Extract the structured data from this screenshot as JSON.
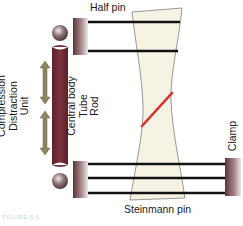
{
  "diagram": {
    "labels": {
      "half_pin": "Half pin",
      "steinmann_pin": "Steinmann pin",
      "clamp": "Clamp",
      "central_body": [
        "Central body",
        "Tube",
        "Rod"
      ],
      "compression_distraction": [
        "Compression",
        "Distraction",
        "Unit"
      ]
    },
    "caption": "FIGURE 5.5",
    "colors": {
      "rod": "#6e2a34",
      "clamp_dark": "#5a3338",
      "clamp_light": "#e8dcdc",
      "bone_fill": "#f6f3e4",
      "bone_stroke": "#555555",
      "pin": "#111111",
      "fracture": "#d8312a",
      "arrow": "#8a8560",
      "ball": "#6a5458"
    },
    "components": [
      {
        "id": "half-pins",
        "count": 2
      },
      {
        "id": "steinmann-pins",
        "count": 3
      },
      {
        "id": "clamps",
        "count": 3
      },
      {
        "id": "central-rod",
        "count": 1
      },
      {
        "id": "ball-joints",
        "count": 2
      },
      {
        "id": "compression-distraction-arrows",
        "count": 2
      },
      {
        "id": "fracture-line",
        "count": 1
      }
    ]
  }
}
